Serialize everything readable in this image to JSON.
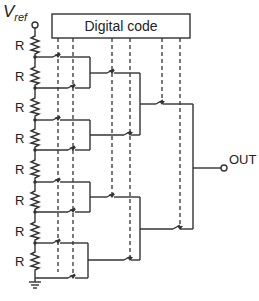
{
  "diagram": {
    "vref_label": "V",
    "vref_sub": "ref",
    "code_box_label": "Digital code",
    "output_label": "OUT",
    "resistor_label": "R",
    "resistor_count": 8,
    "resistor_labels": [
      "R",
      "R",
      "R",
      "R",
      "R",
      "R",
      "R",
      "R"
    ],
    "ground_label": "",
    "colors": {
      "line": "#333333",
      "background": "#ffffff"
    }
  }
}
